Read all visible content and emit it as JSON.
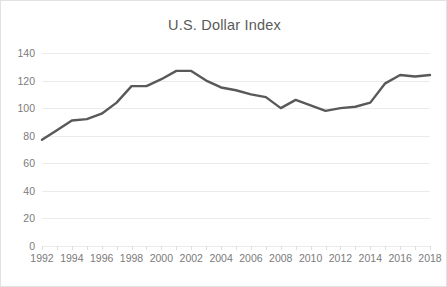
{
  "chart": {
    "title": "U.S. Dollar Index",
    "line_color": "#595959",
    "grid_color": "#eceaea",
    "tick_color": "#7b7b7b",
    "border_color": "#e2e2e2"
  },
  "chart_data": {
    "type": "line",
    "title": "U.S. Dollar Index",
    "xlabel": "",
    "ylabel": "",
    "x": [
      1992,
      1993,
      1994,
      1995,
      1996,
      1997,
      1998,
      1999,
      2000,
      2001,
      2002,
      2003,
      2004,
      2005,
      2006,
      2007,
      2008,
      2009,
      2010,
      2011,
      2012,
      2013,
      2014,
      2015,
      2016,
      2017,
      2018
    ],
    "values": [
      77,
      84,
      91,
      92,
      96,
      104,
      116,
      116,
      121,
      127,
      127,
      120,
      115,
      113,
      110,
      108,
      100,
      106,
      102,
      98,
      100,
      101,
      104,
      118,
      124,
      123,
      124
    ],
    "series": [
      {
        "name": "U.S. Dollar Index",
        "values": [
          77,
          84,
          91,
          92,
          96,
          104,
          116,
          116,
          121,
          127,
          127,
          120,
          115,
          113,
          110,
          108,
          100,
          106,
          102,
          98,
          100,
          101,
          104,
          118,
          124,
          123,
          124
        ]
      }
    ],
    "x_tick_labels": [
      "1992",
      "1994",
      "1996",
      "1998",
      "2000",
      "2002",
      "2004",
      "2006",
      "2008",
      "2010",
      "2012",
      "2014",
      "2016",
      "2018"
    ],
    "x_tick_values": [
      1992,
      1994,
      1996,
      1998,
      2000,
      2002,
      2004,
      2006,
      2008,
      2010,
      2012,
      2014,
      2016,
      2018
    ],
    "y_tick_labels": [
      "0",
      "20",
      "40",
      "60",
      "80",
      "100",
      "120",
      "140"
    ],
    "y_tick_values": [
      0,
      20,
      40,
      60,
      80,
      100,
      120,
      140
    ],
    "xlim": [
      1992,
      2018
    ],
    "ylim": [
      0,
      140
    ],
    "grid": "horizontal",
    "legend": "none",
    "markers": false
  }
}
